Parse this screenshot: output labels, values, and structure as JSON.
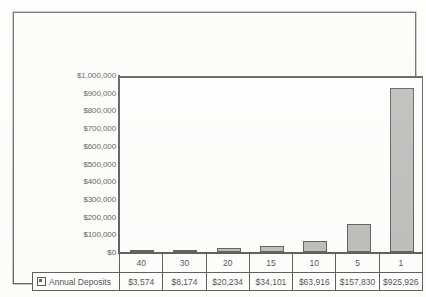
{
  "chart_data": {
    "type": "bar",
    "title": "",
    "xlabel": "",
    "ylabel": "",
    "categories": [
      "40",
      "30",
      "20",
      "15",
      "10",
      "5",
      "1"
    ],
    "series": [
      {
        "name": "Annual Deposits",
        "values": [
          3574,
          8174,
          20234,
          34101,
          63916,
          157830,
          925926
        ],
        "value_labels": [
          "$3,574",
          "$8,174",
          "$20,234",
          "$34,101",
          "$63,916",
          "$157,830",
          "$925,926"
        ]
      }
    ],
    "ylim": [
      0,
      1000000
    ],
    "ytick_labels": [
      "$1,000,000",
      "$900,000",
      "$800,000",
      "$700,000",
      "$600,000",
      "$500,000",
      "$400,000",
      "$300,000",
      "$200,000",
      "$100,000",
      "$0"
    ],
    "ytick_values": [
      1000000,
      900000,
      800000,
      700000,
      600000,
      500000,
      400000,
      300000,
      200000,
      100000,
      0
    ],
    "grid": false,
    "legend_position": "bottom-table",
    "colors": {
      "bar_fill": "#a9a9a9",
      "bar_border": "#2e2e2e",
      "axis": "#2b2b2b",
      "text": "#141414",
      "plot_background": "#ffffff",
      "frame_background": "#fdfdfc"
    },
    "data_table": {
      "legend_label": "Annual Deposits",
      "legend_marker": "square-swatch-icon"
    }
  }
}
